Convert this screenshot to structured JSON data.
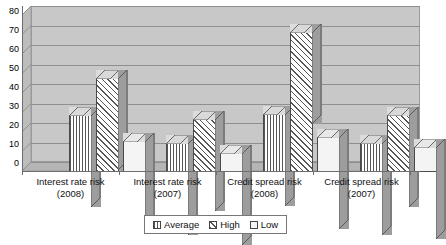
{
  "chart_data": {
    "type": "bar",
    "title": "",
    "xlabel": "",
    "ylabel": "",
    "ylim": [
      0,
      80
    ],
    "yticks": [
      0,
      10,
      20,
      30,
      40,
      50,
      60,
      70,
      80
    ],
    "grid": true,
    "legend_position": "bottom",
    "categories": [
      "Interest rate risk (2008)",
      "Interest rate risk (2007)",
      "Credit spread risk (2008)",
      "Credit spread risk (2007)"
    ],
    "category_lines": [
      {
        "name": "Interest rate risk",
        "year": "(2008)"
      },
      {
        "name": "Interest rate risk",
        "year": "(2007)"
      },
      {
        "name": "Credit spread risk",
        "year": "(2008)"
      },
      {
        "name": "Credit spread risk",
        "year": "(2007)"
      }
    ],
    "series": [
      {
        "name": "Average",
        "values": [
          29,
          15,
          30,
          15
        ],
        "pattern": "vertical-lines"
      },
      {
        "name": "High",
        "values": [
          48,
          27,
          72,
          29
        ],
        "pattern": "diagonal-hatch"
      },
      {
        "name": "Low",
        "values": [
          16,
          10,
          18,
          13
        ],
        "pattern": "solid-white"
      }
    ]
  },
  "legend": {
    "items": [
      {
        "label": "Average",
        "swatch": "swatch-average-icon"
      },
      {
        "label": "High",
        "swatch": "swatch-high-icon"
      },
      {
        "label": "Low",
        "swatch": "swatch-low-icon"
      }
    ]
  },
  "axis": {
    "y_tick_labels": [
      "80",
      "70",
      "60",
      "50",
      "40",
      "30",
      "20",
      "10",
      "0"
    ]
  }
}
